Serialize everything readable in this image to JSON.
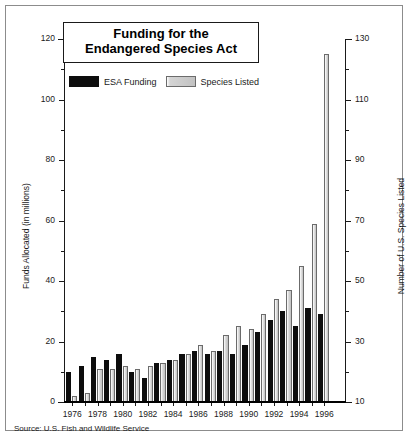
{
  "title": {
    "line1": "Funding for the",
    "line2": "Endangered Species Act"
  },
  "legend": {
    "items": [
      {
        "label": "ESA Funding",
        "color": "#0d0d0d",
        "key": "esa"
      },
      {
        "label": "Species Listed",
        "color": "#c8c8c8",
        "key": "spc"
      }
    ]
  },
  "source": "Source: U.S. Fish and Wildlife Service",
  "axes": {
    "left": {
      "title": "Funds Allocated (in millions)",
      "labels": [
        "0",
        "20",
        "40",
        "60",
        "80",
        "100",
        "120"
      ],
      "min": 0,
      "max": 120,
      "major_step": 20,
      "minor_step": 10
    },
    "right": {
      "title": "Number of U.S. Species Listed",
      "labels": [
        "10",
        "30",
        "50",
        "70",
        "90",
        "110",
        "130"
      ],
      "min": 10,
      "max": 130,
      "major_step": 20,
      "minor_step": 10
    },
    "x": {
      "labels": [
        "1976",
        "1978",
        "1980",
        "1982",
        "1984",
        "1986",
        "1988",
        "1990",
        "1992",
        "1994",
        "1996"
      ]
    }
  },
  "chart_data": {
    "type": "bar",
    "title": "Funding for the Endangered Species Act",
    "xlabel": "",
    "ylabel": "Funds Allocated (in millions)",
    "ylabel_right": "Number of U.S. Species Listed",
    "ylim": [
      0,
      120
    ],
    "ylim_right": [
      10,
      130
    ],
    "grid": false,
    "legend_position": "top-left",
    "categories": [
      "1976",
      "1977",
      "1978",
      "1979",
      "1980",
      "1981",
      "1982",
      "1983",
      "1984",
      "1985",
      "1986",
      "1987",
      "1988",
      "1989",
      "1990",
      "1991",
      "1992",
      "1993",
      "1994",
      "1995",
      "1996"
    ],
    "series": [
      {
        "name": "ESA Funding",
        "axis": "left",
        "unit": "millions of dollars",
        "color": "#0d0d0d",
        "values": [
          10,
          12,
          15,
          14,
          16,
          10,
          8,
          13,
          14,
          16,
          17,
          16,
          17,
          16,
          19,
          23,
          27,
          30,
          25,
          31,
          29
        ]
      },
      {
        "name": "Species Listed",
        "axis": "right",
        "unit": "cumulative U.S. species listed",
        "color": "#c8c8c8",
        "values": [
          12,
          13,
          21,
          21,
          22,
          21,
          22,
          23,
          24,
          26,
          29,
          27,
          32,
          35,
          34,
          39,
          44,
          47,
          55,
          69,
          125
        ]
      }
    ]
  },
  "render": {
    "plot": {
      "left": 60,
      "top": 33,
      "width": 278,
      "height": 363,
      "baseline_y": 396
    },
    "bar": {
      "group_width": 12.6,
      "bar_width": 5.2,
      "gap": 1.0,
      "first_group_left": 60
    }
  }
}
